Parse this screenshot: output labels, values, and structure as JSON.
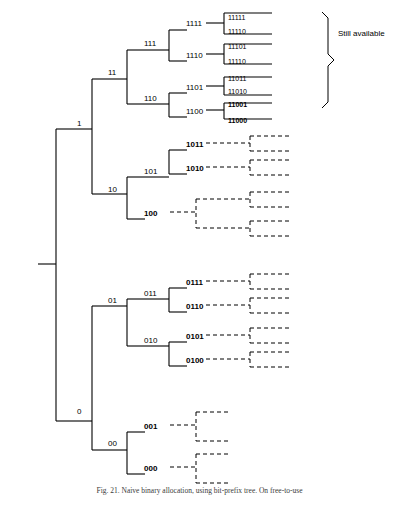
{
  "figure": {
    "annotation": "Still available",
    "caption": "Fig. 21. Naive binary allocation, using bit‐prefix tree. On free‐to‐use",
    "colors": {
      "line": "#000000",
      "dashed": "#000000",
      "text": "#000000",
      "caption": "#3a3a3a"
    },
    "node_labels": [
      {
        "id": "n1",
        "text": "1",
        "x": 77,
        "y": 120,
        "bold": false,
        "size": 8
      },
      {
        "id": "n0",
        "text": "0",
        "x": 77,
        "y": 408,
        "bold": false,
        "size": 8
      },
      {
        "id": "n11",
        "text": "11",
        "x": 108,
        "y": 69,
        "bold": false,
        "size": 8
      },
      {
        "id": "n10",
        "text": "10",
        "x": 108,
        "y": 186,
        "bold": false,
        "size": 8
      },
      {
        "id": "n01",
        "text": "01",
        "x": 108,
        "y": 297,
        "bold": false,
        "size": 8
      },
      {
        "id": "n00",
        "text": "00",
        "x": 108,
        "y": 440,
        "bold": false,
        "size": 8
      },
      {
        "id": "n111",
        "text": "111",
        "x": 144,
        "y": 40,
        "bold": false,
        "size": 8
      },
      {
        "id": "n110",
        "text": "110",
        "x": 144,
        "y": 95,
        "bold": false,
        "size": 8
      },
      {
        "id": "n101",
        "text": "101",
        "x": 144,
        "y": 168,
        "bold": false,
        "size": 8
      },
      {
        "id": "n100",
        "text": "100",
        "x": 144,
        "y": 210,
        "bold": true,
        "size": 8
      },
      {
        "id": "n011",
        "text": "011",
        "x": 144,
        "y": 290,
        "bold": false,
        "size": 8
      },
      {
        "id": "n010",
        "text": "010",
        "x": 144,
        "y": 337,
        "bold": false,
        "size": 8
      },
      {
        "id": "n001",
        "text": "001",
        "x": 144,
        "y": 423,
        "bold": true,
        "size": 8
      },
      {
        "id": "n000",
        "text": "000",
        "x": 144,
        "y": 465,
        "bold": true,
        "size": 8
      },
      {
        "id": "n1111",
        "text": "1111",
        "x": 186,
        "y": 20,
        "bold": false,
        "size": 8
      },
      {
        "id": "n1110",
        "text": "1110",
        "x": 186,
        "y": 52,
        "bold": false,
        "size": 8
      },
      {
        "id": "n1101",
        "text": "1101",
        "x": 186,
        "y": 84,
        "bold": false,
        "size": 8
      },
      {
        "id": "n1100",
        "text": "1100",
        "x": 186,
        "y": 108,
        "bold": false,
        "size": 8
      },
      {
        "id": "n1011",
        "text": "1011",
        "x": 186,
        "y": 141,
        "bold": true,
        "size": 8
      },
      {
        "id": "n1010",
        "text": "1010",
        "x": 186,
        "y": 165,
        "bold": true,
        "size": 8
      },
      {
        "id": "n0111",
        "text": "0111",
        "x": 186,
        "y": 279,
        "bold": true,
        "size": 8
      },
      {
        "id": "n0110",
        "text": "0110",
        "x": 186,
        "y": 303,
        "bold": true,
        "size": 8
      },
      {
        "id": "n0101",
        "text": "0101",
        "x": 186,
        "y": 333,
        "bold": true,
        "size": 8
      },
      {
        "id": "n0100",
        "text": "0100",
        "x": 186,
        "y": 357,
        "bold": true,
        "size": 8
      }
    ],
    "leaf_labels": [
      {
        "id": "l11111",
        "text": "11111",
        "x": 228,
        "y": 14,
        "bold": false,
        "size": 7
      },
      {
        "id": "l11110",
        "text": "11110",
        "x": 228,
        "y": 28,
        "bold": false,
        "size": 7
      },
      {
        "id": "l11101",
        "text": "11101",
        "x": 228,
        "y": 43,
        "bold": false,
        "size": 7
      },
      {
        "id": "l11110b",
        "text": "11110",
        "x": 228,
        "y": 58,
        "bold": false,
        "size": 7
      },
      {
        "id": "l11011",
        "text": "11011",
        "x": 228,
        "y": 75,
        "bold": false,
        "size": 7
      },
      {
        "id": "l11010",
        "text": "11010",
        "x": 228,
        "y": 88,
        "bold": false,
        "size": 7
      },
      {
        "id": "l11001",
        "text": "11001",
        "x": 228,
        "y": 101,
        "bold": true,
        "size": 7
      },
      {
        "id": "l11000",
        "text": "11000",
        "x": 228,
        "y": 117,
        "bold": true,
        "size": 7
      }
    ]
  }
}
